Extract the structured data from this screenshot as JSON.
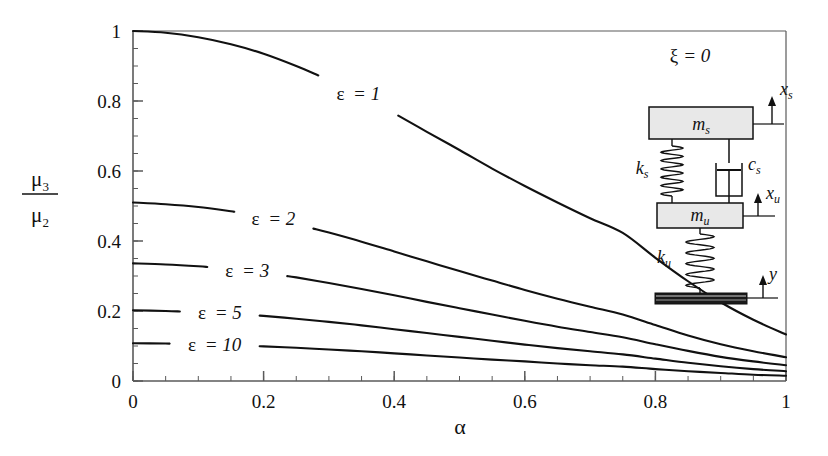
{
  "figure": {
    "background": "#ffffff",
    "line_color": "#111111",
    "axis_color": "#5a5a5a",
    "inset_fill": "#e8e8e8"
  },
  "axes": {
    "x_label": "α",
    "y_label_numerator": "μ",
    "y_label_numerator_sub": "3",
    "y_label_denominator": "μ",
    "y_label_denominator_sub": "2",
    "x_ticks": [
      "0",
      "0.2",
      "0.4",
      "0.6",
      "0.8",
      "1"
    ],
    "y_ticks": [
      "0",
      "0.2",
      "0.4",
      "0.6",
      "0.8",
      "1"
    ],
    "x_tick_values": [
      0,
      0.2,
      0.4,
      0.6,
      0.8,
      1
    ],
    "y_tick_values": [
      0,
      0.2,
      0.4,
      0.6,
      0.8,
      1
    ],
    "x_minor_step": 0.05,
    "y_minor_step": 0.05
  },
  "annotations": {
    "damping_note": "ξ = 0",
    "damping_symbol": "ξ",
    "damping_equals": "= 0"
  },
  "inset": {
    "title": "ξ = 0",
    "sprung_mass": "m",
    "sprung_mass_sub": "s",
    "unsprung_mass": "m",
    "unsprung_mass_sub": "u",
    "suspension_spring": "k",
    "suspension_spring_sub": "s",
    "suspension_damper": "c",
    "suspension_damper_sub": "s",
    "tire_spring": "k",
    "tire_spring_sub": "u",
    "disp_sprung": "x",
    "disp_sprung_sub": "s",
    "disp_unsprung": "x",
    "disp_unsprung_sub": "u",
    "disp_road": "y"
  },
  "chart_data": {
    "type": "line",
    "title": "",
    "xlabel": "α",
    "ylabel": "μ3/μ2",
    "xlim": [
      0,
      1
    ],
    "ylim": [
      0,
      1
    ],
    "grid": false,
    "legend": "inline-curve-labels",
    "annotation": "ξ = 0",
    "x": [
      0,
      0.05,
      0.1,
      0.15,
      0.2,
      0.25,
      0.3,
      0.35,
      0.4,
      0.45,
      0.5,
      0.55,
      0.6,
      0.65,
      0.7,
      0.75,
      0.8,
      0.85,
      0.9,
      0.95,
      1.0
    ],
    "series": [
      {
        "name": "ε = 1",
        "epsilon": 1,
        "label": "ε = 1",
        "label_x": 0.345,
        "label_y": 0.595,
        "values": [
          1.0,
          0.995,
          0.982,
          0.962,
          0.935,
          0.9,
          0.86,
          0.815,
          0.765,
          0.712,
          0.66,
          0.607,
          0.557,
          0.51,
          0.465,
          0.423,
          0.352,
          0.285,
          0.225,
          0.175,
          0.133
        ]
      },
      {
        "name": "ε = 2",
        "epsilon": 2,
        "label": "ε = 2",
        "label_x": 0.215,
        "label_y": 0.4,
        "values": [
          0.51,
          0.505,
          0.497,
          0.485,
          0.468,
          0.448,
          0.424,
          0.398,
          0.37,
          0.342,
          0.314,
          0.287,
          0.26,
          0.235,
          0.212,
          0.19,
          0.16,
          0.13,
          0.105,
          0.085,
          0.068
        ]
      },
      {
        "name": "ε = 3",
        "epsilon": 3,
        "label": "ε = 3",
        "label_x": 0.175,
        "label_y": 0.285,
        "values": [
          0.336,
          0.333,
          0.328,
          0.32,
          0.309,
          0.296,
          0.28,
          0.263,
          0.245,
          0.226,
          0.208,
          0.19,
          0.172,
          0.155,
          0.14,
          0.125,
          0.105,
          0.086,
          0.069,
          0.056,
          0.045
        ]
      },
      {
        "name": "ε = 5",
        "epsilon": 5,
        "label": "ε = 5",
        "label_x": 0.133,
        "label_y": 0.175,
        "values": [
          0.202,
          0.2,
          0.197,
          0.192,
          0.186,
          0.178,
          0.169,
          0.159,
          0.148,
          0.137,
          0.126,
          0.115,
          0.104,
          0.094,
          0.085,
          0.076,
          0.064,
          0.052,
          0.042,
          0.034,
          0.028
        ]
      },
      {
        "name": "ε = 10",
        "epsilon": 10,
        "label": "ε = 10",
        "label_x": 0.125,
        "label_y": 0.08,
        "values": [
          0.108,
          0.107,
          0.105,
          0.103,
          0.099,
          0.095,
          0.09,
          0.085,
          0.079,
          0.073,
          0.067,
          0.061,
          0.056,
          0.05,
          0.045,
          0.041,
          0.034,
          0.028,
          0.023,
          0.018,
          0.015
        ]
      }
    ]
  }
}
